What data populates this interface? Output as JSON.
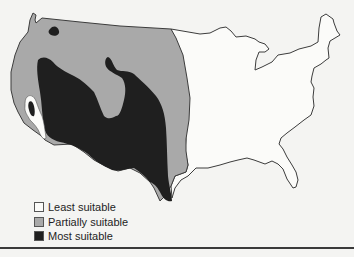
{
  "map": {
    "region": "Contiguous United States",
    "colors": {
      "least": "#fbfbf9",
      "partial": "#a9a9a9",
      "most": "#1f1f1f",
      "outline": "#3c3c3c"
    }
  },
  "legend": {
    "items": [
      {
        "label": "Least suitable",
        "color": "#fbfbf9"
      },
      {
        "label": "Partially suitable",
        "color": "#a9a9a9"
      },
      {
        "label": "Most suitable",
        "color": "#1f1f1f"
      }
    ]
  },
  "caption": {
    "text": ""
  }
}
